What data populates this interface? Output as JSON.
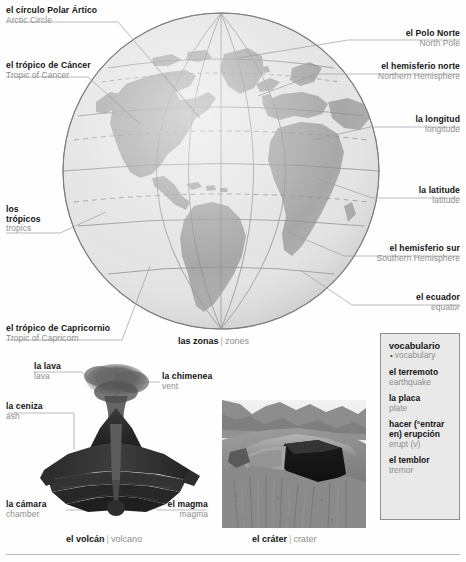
{
  "globe": {
    "caption": {
      "es": "las zonas",
      "sep": "|",
      "en": "zones"
    },
    "labels": {
      "arctic_circle": {
        "es": "el círculo Polar Ártico",
        "en": "Arctic Circle"
      },
      "tropic_cancer": {
        "es": "el trópico de Cáncer",
        "en": "Tropic of Cancer"
      },
      "tropics_line1": {
        "es": "los"
      },
      "tropics_line2": {
        "es": "trópicos",
        "en": "tropics"
      },
      "tropic_capricorn": {
        "es": "el trópico de Capricornio",
        "en": "Tropic of Capricorn"
      },
      "north_pole": {
        "es": "el Polo Norte",
        "en": "North Pole"
      },
      "northern_hemisphere": {
        "es": "el hemisferio norte",
        "en": "Northern Hemisphere"
      },
      "longitude": {
        "es": "la longitud",
        "en": "longitude"
      },
      "latitude": {
        "es": "la latitude",
        "en": "latitude"
      },
      "southern_hemisphere": {
        "es": "el hemisferio sur",
        "en": "Southern Hemisphere"
      },
      "equator": {
        "es": "el ecuador",
        "en": "equator"
      }
    }
  },
  "volcano": {
    "caption": {
      "es": "el volcán",
      "sep": "|",
      "en": "volcano"
    },
    "labels": {
      "lava": {
        "es": "la lava",
        "en": "lava"
      },
      "ash": {
        "es": "la ceniza",
        "en": "ash"
      },
      "vent": {
        "es": "la chimenea",
        "en": "vent"
      },
      "chamber": {
        "es": "la cámara",
        "en": "chamber"
      },
      "magma": {
        "es": "el magma",
        "en": "magma"
      }
    }
  },
  "crater": {
    "caption": {
      "es": "el cráter",
      "sep": "|",
      "en": "crater"
    }
  },
  "vocabulary": {
    "heading": {
      "es": "vocabulario",
      "bullet": "•",
      "en": "vocabulary"
    },
    "entries": [
      {
        "es": "el terremoto",
        "en": "earthquake"
      },
      {
        "es": "la placa",
        "en": "plate"
      },
      {
        "es": "hacer (°entrar en) erupción",
        "en": "erupt (v)"
      },
      {
        "es": "el temblor",
        "en": "tremor"
      }
    ]
  },
  "colors": {
    "land": "#a8a8a8",
    "ocean": "#e4e4e4",
    "graticule": "#8f8f8f",
    "label_en": "#8d8d8d",
    "vocab_bg": "#e9e9e9",
    "vocab_border": "#8e8e8e"
  }
}
